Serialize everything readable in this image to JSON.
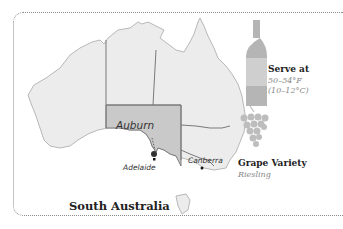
{
  "map": {
    "title": "South Australia",
    "highlighted_region": "South Australia",
    "cities": {
      "auburn": "Auburn",
      "adelaide": "Adelaide",
      "canberra": "Canberra"
    },
    "colors": {
      "land": "#ececec",
      "highlight": "#c9c9c9",
      "border": "#7a7a7a",
      "coast": "#b8b8b8"
    }
  },
  "serve": {
    "icon": "wine-bottle-icon",
    "heading": "Serve at",
    "temp_f": "50–54°F",
    "temp_c": "(10–12°C)"
  },
  "grape": {
    "icon": "grape-cluster-icon",
    "heading": "Grape Variety",
    "value": "Riesling"
  }
}
